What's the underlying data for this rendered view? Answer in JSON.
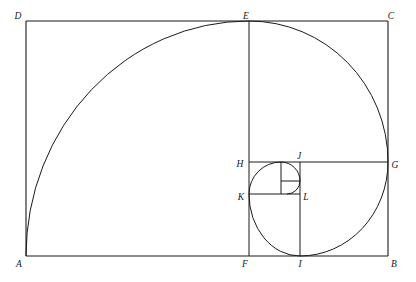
{
  "figure": {
    "type": "geometric-diagram",
    "canvas": {
      "width": 416,
      "height": 282
    },
    "stroke_color": "#1a1a1a",
    "background_color": "#ffffff",
    "stroke_width": 1
  },
  "labels": {
    "A": "A",
    "B": "B",
    "C": "C",
    "D": "D",
    "E": "E",
    "F": "F",
    "G": "G",
    "H": "H",
    "I": "I",
    "J": "J",
    "K": "K",
    "L": "L"
  },
  "points": {
    "A": {
      "x": 26,
      "y": 256,
      "label_x": 18,
      "label_y": 266
    },
    "B": {
      "x": 388,
      "y": 256,
      "label_x": 391,
      "label_y": 266
    },
    "C": {
      "x": 388,
      "y": 21,
      "label_x": 389,
      "label_y": 19
    },
    "D": {
      "x": 26,
      "y": 21,
      "label_x": 18,
      "label_y": 19
    },
    "E": {
      "x": 249,
      "y": 21,
      "label_x": 245,
      "label_y": 19
    },
    "F": {
      "x": 249,
      "y": 256,
      "label_x": 244,
      "label_y": 266
    },
    "G": {
      "x": 388,
      "y": 162,
      "label_x": 392,
      "label_y": 168
    },
    "H": {
      "x": 249,
      "y": 162,
      "label_x": 237,
      "label_y": 167
    },
    "I": {
      "x": 300,
      "y": 256,
      "label_x": 297,
      "label_y": 266
    },
    "J": {
      "x": 300,
      "y": 162,
      "label_x": 297,
      "label_y": 159
    },
    "K": {
      "x": 249,
      "y": 194,
      "label_x": 238,
      "label_y": 199
    },
    "L": {
      "x": 300,
      "y": 194,
      "label_x": 303,
      "label_y": 199
    }
  },
  "segments": [
    {
      "name": "side-AB",
      "x1": 26,
      "y1": 256,
      "x2": 388,
      "y2": 256
    },
    {
      "name": "side-BC",
      "x1": 388,
      "y1": 256,
      "x2": 388,
      "y2": 21
    },
    {
      "name": "side-CD",
      "x1": 388,
      "y1": 21,
      "x2": 26,
      "y2": 21
    },
    {
      "name": "side-DA",
      "x1": 26,
      "y1": 21,
      "x2": 26,
      "y2": 256
    },
    {
      "name": "segment-EF",
      "x1": 249,
      "y1": 21,
      "x2": 249,
      "y2": 256
    },
    {
      "name": "segment-HG",
      "x1": 249,
      "y1": 162,
      "x2": 388,
      "y2": 162
    },
    {
      "name": "segment-IJ",
      "x1": 300,
      "y1": 256,
      "x2": 300,
      "y2": 162
    },
    {
      "name": "segment-KL",
      "x1": 249,
      "y1": 194,
      "x2": 300,
      "y2": 194
    },
    {
      "name": "segment-inner-vertical",
      "x1": 281,
      "y1": 162,
      "x2": 281,
      "y2": 194
    },
    {
      "name": "segment-inner-horizontal",
      "x1": 281,
      "y1": 181,
      "x2": 300,
      "y2": 181
    },
    {
      "name": "segment-innermost-vertical",
      "x1": 281,
      "y1": 181,
      "x2": 281,
      "y2": 194
    }
  ],
  "spiral": {
    "name": "golden-spiral",
    "description": "Sequence of quarter-circle arcs of decreasing radius",
    "arcs": [
      {
        "name": "arc-A-to-E",
        "start_x": 26,
        "start_y": 256,
        "end_x": 249,
        "end_y": 21,
        "radius": 235,
        "center_x": 249,
        "center_y": 256
      },
      {
        "name": "arc-E-to-G",
        "start_x": 249,
        "start_y": 21,
        "end_x": 388,
        "end_y": 162,
        "radius": 139,
        "center_x": 249,
        "center_y": 162
      },
      {
        "name": "arc-G-to-I",
        "start_x": 388,
        "start_y": 162,
        "end_x": 300,
        "end_y": 256,
        "radius": 88,
        "center_x": 300,
        "center_y": 162
      },
      {
        "name": "arc-I-to-K",
        "start_x": 300,
        "start_y": 256,
        "end_x": 249,
        "end_y": 194,
        "radius": 57,
        "center_x": 300,
        "center_y": 194
      },
      {
        "name": "arc-K-to-J",
        "start_x": 249,
        "start_y": 194,
        "end_x": 281,
        "end_y": 162,
        "radius": 32,
        "center_x": 281,
        "center_y": 194
      },
      {
        "name": "arc-J-to-inner",
        "start_x": 281,
        "start_y": 162,
        "end_x": 300,
        "end_y": 181,
        "radius": 19,
        "center_x": 281,
        "center_y": 181
      },
      {
        "name": "arc-inner-last",
        "start_x": 300,
        "start_y": 181,
        "end_x": 290,
        "end_y": 190,
        "radius": 12,
        "center_x": 290,
        "center_y": 181
      }
    ]
  }
}
